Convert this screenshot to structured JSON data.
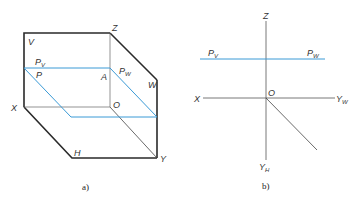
{
  "colors": {
    "line": "#2a2a2a",
    "thin": "#555555",
    "plane": "#3a9ad6",
    "text": "#333333"
  },
  "panel_a": {
    "caption": "a)",
    "labels": {
      "V": "V",
      "Z": "Z",
      "P": "P",
      "A": "A",
      "W": "W",
      "X": "X",
      "O": "O",
      "H": "H",
      "Y": "Y",
      "Pv_main": "P",
      "Pv_sub": "V",
      "Pw_main": "P",
      "Pw_sub": "W"
    }
  },
  "panel_b": {
    "caption": "b)",
    "labels": {
      "Z": "Z",
      "X": "X",
      "O": "O",
      "Pv_main": "P",
      "Pv_sub": "V",
      "Pw_main": "P",
      "Pw_sub": "W",
      "Yw_main": "Y",
      "Yw_sub": "W",
      "Yh_main": "Y",
      "Yh_sub": "H"
    }
  }
}
